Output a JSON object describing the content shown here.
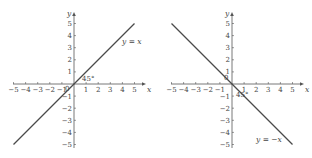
{
  "chart_data": [
    {
      "type": "line",
      "title": "",
      "xlabel": "x",
      "ylabel": "y",
      "xlim": [
        -5,
        5
      ],
      "ylim": [
        -5,
        5
      ],
      "grid": false,
      "x_ticks": [
        -5,
        -4,
        -3,
        -2,
        -1,
        0,
        1,
        2,
        3,
        4,
        5
      ],
      "y_ticks": [
        -5,
        -4,
        -3,
        -2,
        -1,
        1,
        2,
        3,
        4,
        5
      ],
      "x_tick_labels": [
        "−5",
        "−4",
        "−3",
        "−2",
        "−1",
        "0",
        "1",
        "2",
        "3",
        "4",
        "5"
      ],
      "y_tick_labels": [
        "−5",
        "−4",
        "−3",
        "−2",
        "−1",
        "1",
        "2",
        "3",
        "4",
        "5"
      ],
      "series": [
        {
          "name": "y = x",
          "x": [
            -5,
            5
          ],
          "y": [
            -5,
            5
          ]
        }
      ],
      "annotations": [
        {
          "text": "y = x",
          "x": 3.4,
          "y": 3.2
        },
        {
          "text": "45°",
          "x": 0.7,
          "y": 0.3
        }
      ],
      "origin_label": "0",
      "x_axis_name": "x",
      "y_axis_name": "y",
      "equation_label": {
        "var": "y",
        "rest": " = ",
        "rhs": "x"
      },
      "angle_label": "45°"
    },
    {
      "type": "line",
      "title": "",
      "xlabel": "x",
      "ylabel": "y",
      "xlim": [
        -5,
        5
      ],
      "ylim": [
        -5,
        5
      ],
      "grid": false,
      "x_ticks": [
        -5,
        -4,
        -3,
        -2,
        -1,
        0,
        1,
        2,
        3,
        4,
        5
      ],
      "y_ticks": [
        -5,
        -4,
        -3,
        -2,
        -1,
        1,
        2,
        3,
        4,
        5
      ],
      "x_tick_labels": [
        "−5",
        "−4",
        "−3",
        "−2",
        "−1",
        "0",
        "1",
        "2",
        "3",
        "4",
        "5"
      ],
      "y_tick_labels": [
        "−5",
        "−4",
        "−3",
        "−2",
        "−1",
        "1",
        "2",
        "3",
        "4",
        "5"
      ],
      "series": [
        {
          "name": "y = −x",
          "x": [
            -5,
            5
          ],
          "y": [
            5,
            -5
          ]
        }
      ],
      "annotations": [
        {
          "text": "y = −x",
          "x": 2.0,
          "y": -4.6
        },
        {
          "text": "45°",
          "x": 0.2,
          "y": -1.2
        }
      ],
      "origin_label": "0",
      "x_axis_name": "x",
      "y_axis_name": "y",
      "equation_label": {
        "var": "y",
        "rest": " = −",
        "rhs": "x"
      },
      "angle_label": "45°"
    }
  ],
  "style": {
    "line_color": "#4a4a4a",
    "axis_color": "#555555",
    "text_color": "#444444"
  }
}
